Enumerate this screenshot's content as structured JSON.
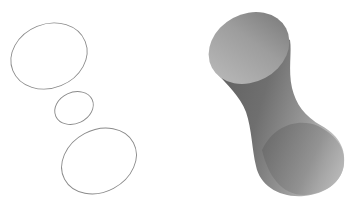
{
  "figure": {
    "width": 355,
    "height": 209,
    "background": "#ffffff",
    "left_panel": {
      "description": "three elliptical cross-section outlines",
      "stroke_color": "#8a8a8a",
      "ellipses": [
        {
          "name": "top-cross-section",
          "cx": 49,
          "cy": 56,
          "rx": 39,
          "ry": 32,
          "rotate": -22
        },
        {
          "name": "waist-cross-section",
          "cx": 74,
          "cy": 108,
          "rx": 20,
          "ry": 15.5,
          "rotate": -25
        },
        {
          "name": "bottom-cross-section",
          "cx": 99,
          "cy": 161,
          "rx": 39,
          "ry": 31,
          "rotate": -28
        }
      ]
    },
    "right_panel": {
      "description": "shaded hyperboloid-like surface",
      "cap_light": "#b3b3b3",
      "cap_dark": "#8c8c8c",
      "body_dark": "#6a6a6a",
      "body_light": "#b8b8b8"
    }
  }
}
